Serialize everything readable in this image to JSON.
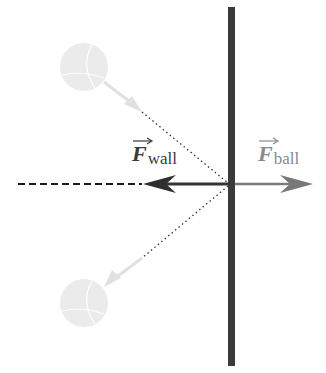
{
  "diagram": {
    "labels": {
      "force_wall": {
        "symbol": "F",
        "subscript": "wall",
        "vector": true
      },
      "force_ball": {
        "symbol": "F",
        "subscript": "ball",
        "vector": true
      }
    },
    "elements": {
      "wall": {
        "x": 231,
        "y_top": 7,
        "y_bottom": 366,
        "width": 7,
        "color": "#3a3a3a"
      },
      "normal_line": {
        "style": "dashed",
        "y": 184,
        "x_start": 18,
        "x_end": 140,
        "color": "#1a1a1a"
      },
      "force_wall_arrow": {
        "from_x": 231,
        "to_x": 143,
        "y": 184,
        "color": "#333333"
      },
      "force_ball_arrow": {
        "from_x": 231,
        "to_x": 313,
        "y": 184,
        "color": "#777777"
      },
      "incoming_path": {
        "style": "dotted",
        "from": [
          142,
          112
        ],
        "to": [
          228,
          183
        ]
      },
      "outgoing_path": {
        "style": "dotted",
        "from": [
          228,
          186
        ],
        "to": [
          142,
          258
        ]
      },
      "ball_incoming": {
        "cx": 84,
        "cy": 67,
        "r": 24,
        "color": "#e6e6e6"
      },
      "ball_outgoing": {
        "cx": 84,
        "cy": 303,
        "r": 24,
        "color": "#e6e6e6"
      }
    },
    "colors": {
      "wall": "#3a3a3a",
      "force_wall": "#333333",
      "force_ball": "#7a7a7a",
      "ball": "#e6e6e6",
      "ghost_arrow": "#dcdcdc"
    }
  }
}
